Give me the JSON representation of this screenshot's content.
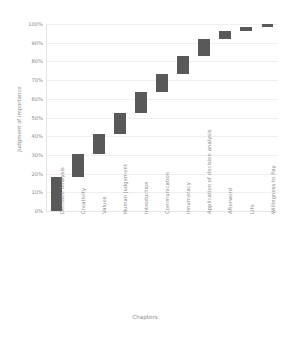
{
  "chart_data": {
    "type": "bar",
    "subtype": "waterfall",
    "title": "",
    "xlabel": "Chapters",
    "ylabel": "Judgment of importance",
    "ylim": [
      0,
      100
    ],
    "yunit": "%",
    "grid": true,
    "legend": "none",
    "bar_color": "#595959",
    "ytick_labels": [
      "100%",
      "90%",
      "80%",
      "70%",
      "60%",
      "50%",
      "40%",
      "30%",
      "20%",
      "10%",
      "0%"
    ],
    "ytick_values": [
      100,
      90,
      80,
      70,
      60,
      50,
      40,
      30,
      20,
      10,
      0
    ],
    "categories": [
      "Decision Analysis",
      "Creativity",
      "Values",
      "Human Judgement",
      "Introduction",
      "Communication",
      "Innumeracy",
      "Application of decision analysis",
      "Afterword",
      "Life",
      "Willingness to Pay"
    ],
    "bars": [
      {
        "category": "Decision Analysis",
        "base": 0,
        "top": 18.0,
        "value": 18.0
      },
      {
        "category": "Creativity",
        "base": 18.0,
        "top": 30.5,
        "value": 12.5
      },
      {
        "category": "Values",
        "base": 30.5,
        "top": 41.0,
        "value": 10.5
      },
      {
        "category": "Human Judgement",
        "base": 41.0,
        "top": 52.5,
        "value": 11.5
      },
      {
        "category": "Introduction",
        "base": 52.5,
        "top": 63.5,
        "value": 11.0
      },
      {
        "category": "Communication",
        "base": 63.5,
        "top": 73.5,
        "value": 10.0
      },
      {
        "category": "Innumeracy",
        "base": 73.5,
        "top": 83.0,
        "value": 9.5
      },
      {
        "category": "Application of decision analysis",
        "base": 83.0,
        "top": 92.0,
        "value": 9.0
      },
      {
        "category": "Afterword",
        "base": 92.0,
        "top": 96.5,
        "value": 4.5
      },
      {
        "category": "Life",
        "base": 96.5,
        "top": 98.5,
        "value": 2.0
      },
      {
        "category": "Willingness to Pay",
        "base": 98.5,
        "top": 100.0,
        "value": 1.5
      }
    ],
    "cumulative": [
      18.0,
      30.5,
      41.0,
      52.5,
      63.5,
      73.5,
      83.0,
      92.0,
      96.5,
      98.5,
      100.0
    ]
  },
  "colors": {
    "bar": "#595959",
    "grid": "#f0eeee",
    "axis": "#e6e4e4",
    "text": "#8a8a8a",
    "background": "#ffffff"
  }
}
